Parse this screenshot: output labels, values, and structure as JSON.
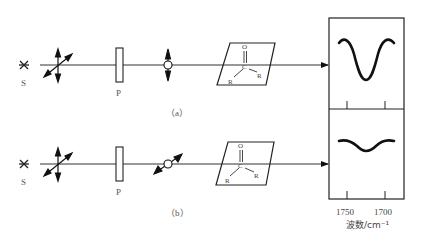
{
  "diagram": {
    "row_a": {
      "source_label": "S",
      "polarizer_label": "P",
      "caption": "（a）",
      "molecule": {
        "top_atom": "O",
        "center_atom": "C",
        "left_group": "R",
        "right_group": "R"
      }
    },
    "row_b": {
      "source_label": "S",
      "polarizer_label": "P",
      "caption": "（b）",
      "molecule": {
        "top_atom": "O",
        "center_atom": "C",
        "left_group": "R",
        "right_group": "R"
      }
    },
    "spectrum": {
      "x_ticks": [
        "1750",
        "1700"
      ],
      "x_label": "波数/cm⁻¹"
    },
    "colors": {
      "line": "#111111",
      "text": "#444444"
    }
  }
}
